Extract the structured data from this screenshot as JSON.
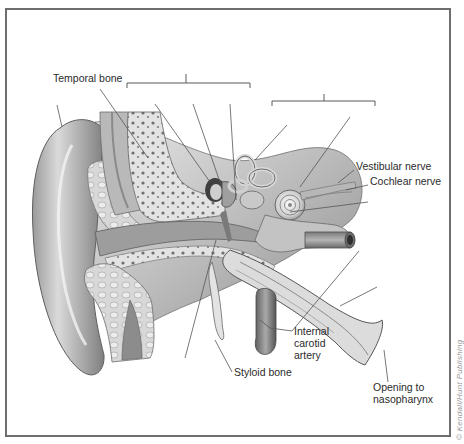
{
  "figure": {
    "labels": [
      {
        "id": "temporal-bone",
        "text": "Temporal bone",
        "x": 53,
        "y": 76
      },
      {
        "id": "vestibular-nerve",
        "text": "Vestibular nerve",
        "x": 356,
        "y": 164
      },
      {
        "id": "cochlear-nerve",
        "text": "Cochlear nerve",
        "x": 370,
        "y": 179
      },
      {
        "id": "internal-carotid-artery-line1",
        "text": "Internal",
        "x": 294,
        "y": 336
      },
      {
        "id": "internal-carotid-artery-line2",
        "text": "carotid",
        "x": 294,
        "y": 348
      },
      {
        "id": "internal-carotid-artery-line3",
        "text": "artery",
        "x": 294,
        "y": 360
      },
      {
        "id": "styloid-bone",
        "text": "Styloid bone",
        "x": 234,
        "y": 372
      },
      {
        "id": "opening-to-nasopharynx-line1",
        "text": "Opening to",
        "x": 373,
        "y": 386
      },
      {
        "id": "opening-to-nasopharynx-line2",
        "text": "nasopharynx",
        "x": 373,
        "y": 398
      }
    ],
    "brackets": [
      {
        "id": "middle-ear-bracket",
        "x1": 127,
        "x2": 250,
        "y": 83,
        "tick_x": 186,
        "tick_top": 74
      },
      {
        "id": "inner-ear-bracket",
        "x1": 272,
        "x2": 375,
        "y": 101,
        "tick_x": 324,
        "tick_top": 94
      }
    ],
    "unlabeled_leaders": [
      {
        "id": "outer-ear-leader",
        "x1": 57,
        "y1": 105,
        "x2": 62,
        "y2": 127
      },
      {
        "id": "ear-canal-leader",
        "x1": 155,
        "y1": 104,
        "x2": 210,
        "y2": 182
      },
      {
        "id": "malleus-leader",
        "x1": 193,
        "y1": 104,
        "x2": 222,
        "y2": 188
      },
      {
        "id": "incus-leader",
        "x1": 230,
        "y1": 104,
        "x2": 236,
        "y2": 200
      },
      {
        "id": "semicircular-canals-leader",
        "x1": 287,
        "y1": 125,
        "x2": 255,
        "y2": 160
      },
      {
        "id": "cochlea-leader",
        "x1": 350,
        "y1": 117,
        "x2": 300,
        "y2": 187
      },
      {
        "id": "cochlear-window-leader",
        "x1": 368,
        "y1": 202,
        "x2": 290,
        "y2": 212
      },
      {
        "id": "eustachian-tube-leader",
        "x1": 377,
        "y1": 287,
        "x2": 340,
        "y2": 306
      },
      {
        "id": "earlobe-leader",
        "x1": 216,
        "y1": 240,
        "x2": 185,
        "y2": 358
      }
    ],
    "copyright": "© Kendall/Hunt Publishing"
  },
  "colors": {
    "frame": "#6e6e6e",
    "line": "#555555",
    "text": "#2b2b2b"
  }
}
